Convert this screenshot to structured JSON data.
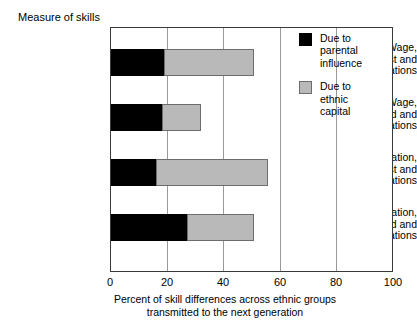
{
  "chart_data": {
    "type": "bar",
    "orientation": "horizontal",
    "stacked": true,
    "title": "Measure of skills",
    "xlabel_line1": "Percent of skill differences across ethnic groups",
    "xlabel_line2": "transmitted to the next generation",
    "ylabel": "Measure of skills",
    "xlim": [
      0,
      100
    ],
    "xticks": [
      "0",
      "20",
      "40",
      "60",
      "80",
      "100"
    ],
    "grid": "vertical",
    "legend_position": "top-right-inside",
    "categories": [
      {
        "line1": "Wage,",
        "line2": "between 1st and",
        "line3": "2nd generations"
      },
      {
        "line1": "Wage,",
        "line2": "between 2nd and",
        "line3": "3rd generations"
      },
      {
        "line1": "Education,",
        "line2": "between 1st and",
        "line3": "2nd generations"
      },
      {
        "line1": "Education,",
        "line2": "between 2nd and",
        "line3": "3rd generations"
      }
    ],
    "series": [
      {
        "name": "Due to parental influence",
        "color": "#000000",
        "values": [
          19,
          18,
          16,
          27
        ]
      },
      {
        "name": "Due to ethnic capital",
        "color": "#b9b9b9",
        "values": [
          32,
          14,
          40,
          24
        ]
      }
    ],
    "totals": [
      51,
      32,
      56,
      51
    ]
  },
  "legend": {
    "entries": [
      {
        "swatch": "black",
        "l1": "Due to",
        "l2": "parental",
        "l3": "influence"
      },
      {
        "swatch": "gray",
        "l1": "Due to",
        "l2": "ethnic",
        "l3": "capital"
      }
    ]
  }
}
